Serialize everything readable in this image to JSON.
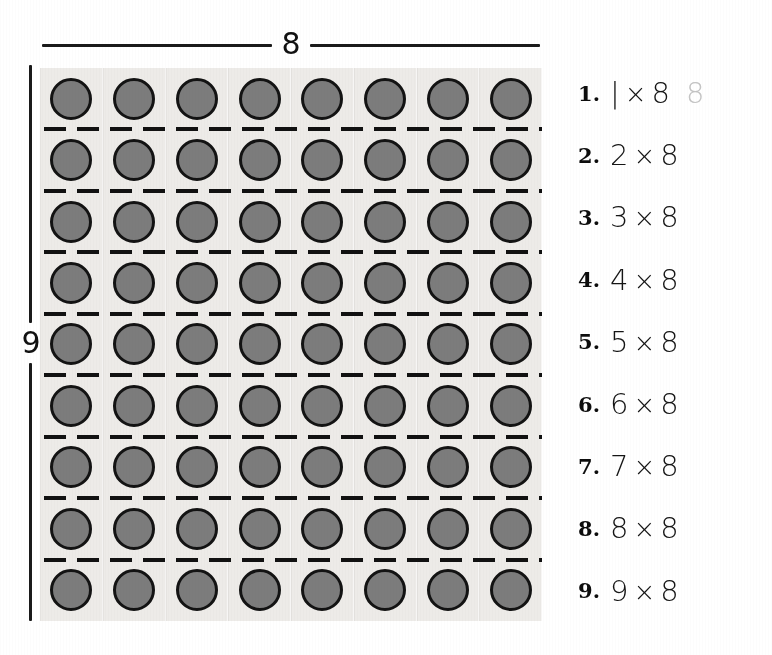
{
  "worksheet": {
    "columns_label": "8",
    "rows_label": "9",
    "columns": 8,
    "rows": 9,
    "counter_color": "#7c7c7c",
    "counter_outline_color": "#131313",
    "grid_background": "#edebe8",
    "answer_color": "#c4c4c4"
  },
  "facts": [
    {
      "number": "1.",
      "left": "|",
      "times": "×",
      "right": "8",
      "answer": "8"
    },
    {
      "number": "2.",
      "left": "2",
      "times": "×",
      "right": "8",
      "answer": ""
    },
    {
      "number": "3.",
      "left": "3",
      "times": "×",
      "right": "8",
      "answer": ""
    },
    {
      "number": "4.",
      "left": "4",
      "times": "×",
      "right": "8",
      "answer": ""
    },
    {
      "number": "5.",
      "left": "5",
      "times": "×",
      "right": "8",
      "answer": ""
    },
    {
      "number": "6.",
      "left": "6",
      "times": "×",
      "right": "8",
      "answer": ""
    },
    {
      "number": "7.",
      "left": "7",
      "times": "×",
      "right": "8",
      "answer": ""
    },
    {
      "number": "8.",
      "left": "8",
      "times": "×",
      "right": "8",
      "answer": ""
    },
    {
      "number": "9.",
      "left": "9",
      "times": "×",
      "right": "8",
      "answer": ""
    }
  ]
}
